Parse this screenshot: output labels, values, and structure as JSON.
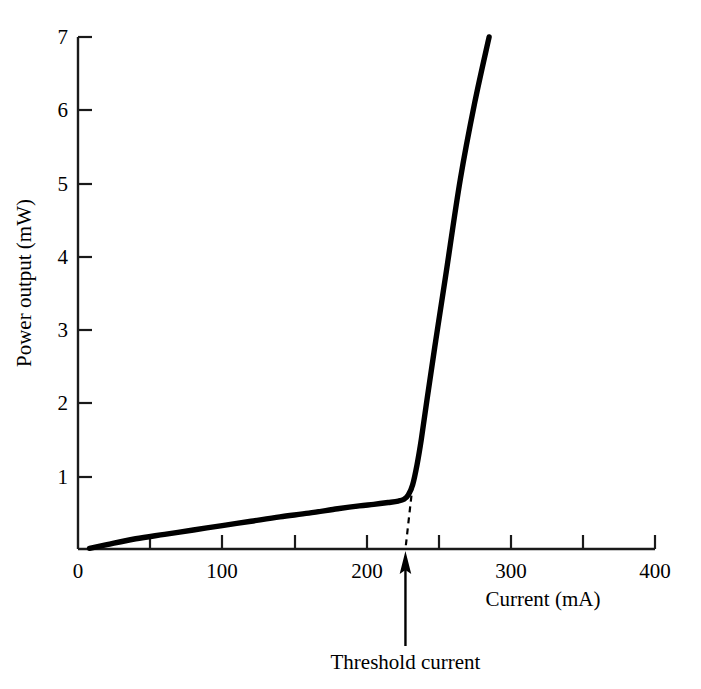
{
  "chart_data": {
    "type": "line",
    "title": "",
    "subtitle": "",
    "xlabel": "Current (mA)",
    "ylabel": "Power output (mW)",
    "xlim": [
      0,
      400
    ],
    "ylim": [
      0,
      7
    ],
    "xticks": [
      0,
      50,
      100,
      150,
      200,
      250,
      300,
      350,
      400
    ],
    "xtick_labels": [
      "0",
      "",
      "100",
      "",
      "200",
      "",
      "300",
      "",
      "400"
    ],
    "xtick_labels_shown": [
      "0",
      "100",
      "200",
      "300",
      "400"
    ],
    "yticks": [
      0,
      1,
      2,
      3,
      4,
      5,
      6,
      7
    ],
    "ytick_labels": [
      "",
      "1",
      "2",
      "3",
      "4",
      "5",
      "6",
      "7"
    ],
    "ytick_labels_shown": [
      "1",
      "2",
      "3",
      "4",
      "5",
      "6",
      "7"
    ],
    "grid": false,
    "legend": false,
    "legend_position": "none",
    "line_color": "#000000",
    "line_width_px": 5,
    "series": [
      {
        "name": "Laser diode L-I curve",
        "x": [
          8,
          20,
          40,
          60,
          80,
          100,
          120,
          140,
          160,
          180,
          195,
          205,
          215,
          222,
          226,
          229,
          232,
          235,
          238,
          242,
          248,
          255,
          265,
          275,
          285
        ],
        "values": [
          0.01,
          0.06,
          0.14,
          0.2,
          0.26,
          0.32,
          0.38,
          0.44,
          0.49,
          0.55,
          0.59,
          0.61,
          0.635,
          0.655,
          0.68,
          0.74,
          0.88,
          1.15,
          1.5,
          2.05,
          2.85,
          3.75,
          5.05,
          6.1,
          7.0
        ]
      }
    ],
    "annotations": [
      {
        "name": "threshold-extrapolation",
        "type": "dashed-line",
        "from": [
          232,
          0.88
        ],
        "to": [
          227,
          0.0
        ],
        "dash": "6,5"
      },
      {
        "name": "threshold-arrow",
        "type": "arrow",
        "label": "Threshold current",
        "x": 227,
        "from_y_px": 646,
        "to_y_px": 552,
        "label_position": "below-axis"
      }
    ]
  },
  "axes": {
    "x_label": "Current (mA)",
    "y_label": "Power output (mW)",
    "x_tick_texts": [
      "0",
      "100",
      "200",
      "300",
      "400"
    ],
    "y_tick_texts": [
      "1",
      "2",
      "3",
      "4",
      "5",
      "6",
      "7"
    ]
  },
  "annotation": {
    "threshold_label": "Threshold current"
  },
  "colors": {
    "background": "#ffffff",
    "ink": "#000000",
    "curve": "#000000"
  }
}
